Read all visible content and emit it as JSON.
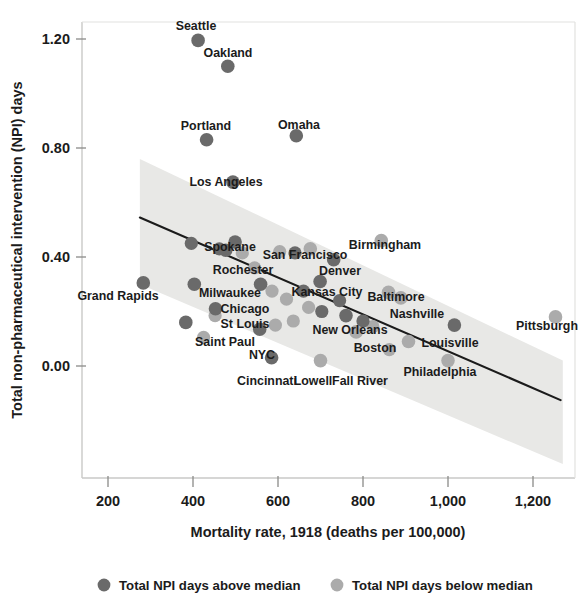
{
  "chart_data": {
    "type": "scatter",
    "title": "",
    "xlabel": "Mortality rate, 1918 (deaths per 100,000)",
    "ylabel": "Total non-pharmaceutical intervention (NPI) days",
    "xlim": [
      155,
      1275
    ],
    "ylim": [
      -0.18,
      1.32
    ],
    "xticks": [
      200,
      400,
      600,
      800,
      1000,
      1200
    ],
    "xtick_labels": [
      "200",
      "400",
      "600",
      "800",
      "1,000",
      "1,200"
    ],
    "yticks": [
      0.0,
      0.4,
      0.8,
      1.2
    ],
    "ytick_labels": [
      "0.00",
      "0.40",
      "0.80",
      "1.20"
    ],
    "grid": false,
    "legend_position": "bottom",
    "legend": [
      {
        "key": "above",
        "label": "Total NPI days above median",
        "color": "#6a6a6a"
      },
      {
        "key": "below",
        "label": "Total NPI days below median",
        "color": "#ababab"
      }
    ],
    "series": [
      {
        "name": "Total NPI days above median",
        "key": "above",
        "color": "#6a6a6a",
        "points": [
          {
            "label": "Seattle",
            "x": 412,
            "y": 1.195,
            "lx": 196,
            "ly": 30,
            "anchor": "middle"
          },
          {
            "label": "Oakland",
            "x": 482,
            "y": 1.1,
            "lx": 228,
            "ly": 57,
            "anchor": "middle"
          },
          {
            "label": "Portland",
            "x": 432,
            "y": 0.83,
            "lx": 206,
            "ly": 130,
            "anchor": "middle"
          },
          {
            "label": "Omaha",
            "x": 643,
            "y": 0.845,
            "lx": 299,
            "ly": 129,
            "anchor": "middle"
          },
          {
            "label": "Los Angeles",
            "x": 494,
            "y": 0.675,
            "lx": 226,
            "ly": 186,
            "anchor": "middle"
          },
          {
            "label": "Spokane",
            "x": 499,
            "y": 0.455,
            "lx": 230,
            "ly": 251,
            "anchor": "middle"
          },
          {
            "label": "Rochester",
            "x": 477,
            "y": 0.425,
            "lx": 243,
            "ly": 274,
            "anchor": "middle"
          },
          {
            "label": "Grand Rapids",
            "x": 283,
            "y": 0.305,
            "lx": 118,
            "ly": 300,
            "anchor": "middle"
          },
          {
            "label": "Milwaukee",
            "x": 403,
            "y": 0.3,
            "lx": 230,
            "ly": 297,
            "anchor": "middle"
          },
          {
            "label": "Denver",
            "x": 731,
            "y": 0.39,
            "lx": 340,
            "ly": 275,
            "anchor": "middle"
          },
          {
            "label": "Chicago",
            "x": 559,
            "y": 0.3,
            "lx": 245,
            "ly": 313,
            "anchor": "middle"
          },
          {
            "label": "Kansas City",
            "x": 699,
            "y": 0.31,
            "lx": 327,
            "ly": 296,
            "anchor": "middle"
          },
          {
            "label": "St Louis",
            "x": 453,
            "y": 0.21,
            "lx": 245,
            "ly": 328,
            "anchor": "middle"
          },
          {
            "label": "New Orleans",
            "x": 760,
            "y": 0.185,
            "lx": 350,
            "ly": 334,
            "anchor": "middle"
          },
          {
            "label": "Saint Paul",
            "x": 383,
            "y": 0.16,
            "lx": 225,
            "ly": 346,
            "anchor": "middle"
          },
          {
            "label": "NYC",
            "x": 557,
            "y": 0.135,
            "lx": 262,
            "ly": 359,
            "anchor": "middle"
          },
          {
            "label": "Cincinnati",
            "x": 585,
            "y": 0.03,
            "lx": 267,
            "ly": 385,
            "anchor": "middle"
          },
          {
            "label": "Louisville",
            "x": 1015,
            "y": 0.15,
            "lx": 450,
            "ly": 347,
            "anchor": "middle"
          }
        ]
      },
      {
        "name": "Total NPI days below median",
        "key": "below",
        "color": "#ababab",
        "points": [
          {
            "label": "San Francisco",
            "x": 676,
            "y": 0.43,
            "lx": 305,
            "ly": 259,
            "anchor": "middle"
          },
          {
            "label": "Birmingham",
            "x": 843,
            "y": 0.46,
            "lx": 385,
            "ly": 249,
            "anchor": "middle"
          },
          {
            "label": "Baltimore",
            "x": 860,
            "y": 0.27,
            "lx": 396,
            "ly": 301,
            "anchor": "middle"
          },
          {
            "label": "Nashville",
            "x": 889,
            "y": 0.25,
            "lx": 417,
            "ly": 318,
            "anchor": "middle"
          },
          {
            "label": "Boston",
            "x": 784,
            "y": 0.125,
            "lx": 375,
            "ly": 352,
            "anchor": "middle"
          },
          {
            "label": "Philadelphia",
            "x": 907,
            "y": 0.09,
            "lx": 440,
            "ly": 376,
            "anchor": "middle"
          },
          {
            "label": "Fall River",
            "x": 1000,
            "y": 0.02,
            "lx": 360,
            "ly": 385,
            "anchor": "middle"
          },
          {
            "label": "Lowell",
            "x": 700,
            "y": 0.02,
            "lx": 313,
            "ly": 385,
            "anchor": "middle"
          },
          {
            "label": "Pittsburgh",
            "x": 1253,
            "y": 0.18,
            "lx": 547,
            "ly": 330,
            "anchor": "middle"
          }
        ]
      }
    ],
    "unlabeled_points": [
      {
        "series": "above",
        "x": 396,
        "y": 0.45
      },
      {
        "series": "above",
        "x": 462,
        "y": 0.43
      },
      {
        "series": "below",
        "x": 516,
        "y": 0.415
      },
      {
        "series": "below",
        "x": 545,
        "y": 0.36
      },
      {
        "series": "below",
        "x": 604,
        "y": 0.42
      },
      {
        "series": "above",
        "x": 640,
        "y": 0.415
      },
      {
        "series": "below",
        "x": 586,
        "y": 0.275
      },
      {
        "series": "below",
        "x": 620,
        "y": 0.245
      },
      {
        "series": "above",
        "x": 660,
        "y": 0.275
      },
      {
        "series": "below",
        "x": 672,
        "y": 0.215
      },
      {
        "series": "above",
        "x": 703,
        "y": 0.2
      },
      {
        "series": "below",
        "x": 636,
        "y": 0.165
      },
      {
        "series": "below",
        "x": 594,
        "y": 0.15
      },
      {
        "series": "above",
        "x": 745,
        "y": 0.24
      },
      {
        "series": "below",
        "x": 823,
        "y": 0.145
      },
      {
        "series": "above",
        "x": 800,
        "y": 0.165
      },
      {
        "series": "below",
        "x": 452,
        "y": 0.185
      },
      {
        "series": "below",
        "x": 425,
        "y": 0.105
      },
      {
        "series": "below",
        "x": 862,
        "y": 0.06
      }
    ],
    "trend_line": {
      "description": "linear regression fit, negative slope",
      "x_start": 275,
      "y_start": 0.545,
      "x_end": 1265,
      "y_end": -0.125,
      "color": "#1b1b1b"
    },
    "confidence_band": {
      "description": "shaded confidence interval around regression line",
      "color": "#e8e8e6",
      "x_start": 275,
      "x_end": 1270,
      "upper_start": 0.76,
      "upper_end": 0.02,
      "lower_start": 0.3,
      "lower_end": -0.36
    },
    "annotations": []
  }
}
